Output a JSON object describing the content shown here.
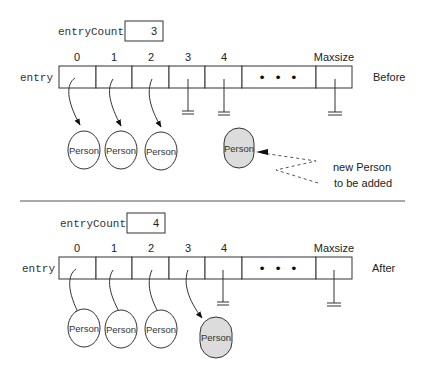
{
  "before": {
    "count_label": "entryCount",
    "count_value": "3",
    "array_label": "entry",
    "indices": [
      "0",
      "1",
      "2",
      "3",
      "4"
    ],
    "maxsize_label": "Maxsize",
    "state_label": "Before",
    "persons": [
      "Person",
      "Person",
      "Person"
    ],
    "new_person": "Person",
    "annotation_line1": "new Person",
    "annotation_line2": "to be added"
  },
  "after": {
    "count_label": "entryCount",
    "count_value": "4",
    "array_label": "entry",
    "indices": [
      "0",
      "1",
      "2",
      "3",
      "4"
    ],
    "maxsize_label": "Maxsize",
    "state_label": "After",
    "persons": [
      "Person",
      "Person",
      "Person",
      "Person"
    ]
  },
  "ellipsis": "• • •",
  "colors": {
    "new_person_fill": "#dcdcdc",
    "stroke": "#333333"
  }
}
